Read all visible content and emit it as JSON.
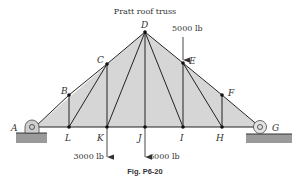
{
  "title": "Pratt roof truss",
  "caption": "Fig. P6-20",
  "colors": {
    "fill": "#d6d6d6",
    "member": "#222222",
    "ground": "#9a9a9a"
  },
  "nodes": {
    "A": {
      "label": "A",
      "x": 35,
      "y": 127
    },
    "B": {
      "label": "B",
      "x": 69,
      "y": 95
    },
    "C": {
      "label": "C",
      "x": 107,
      "y": 64
    },
    "D": {
      "label": "D",
      "x": 145,
      "y": 32
    },
    "E": {
      "label": "E",
      "x": 183,
      "y": 63
    },
    "F": {
      "label": "F",
      "x": 222,
      "y": 95
    },
    "G": {
      "label": "G",
      "x": 260,
      "y": 127
    },
    "H": {
      "label": "H",
      "x": 222,
      "y": 127
    },
    "I": {
      "label": "I",
      "x": 183,
      "y": 127
    },
    "J": {
      "label": "J",
      "x": 145,
      "y": 127
    },
    "K": {
      "label": "K",
      "x": 107,
      "y": 127
    },
    "L": {
      "label": "L",
      "x": 69,
      "y": 127
    }
  },
  "members": [
    [
      "A",
      "B"
    ],
    [
      "B",
      "C"
    ],
    [
      "C",
      "D"
    ],
    [
      "D",
      "E"
    ],
    [
      "E",
      "F"
    ],
    [
      "F",
      "G"
    ],
    [
      "A",
      "L"
    ],
    [
      "L",
      "K"
    ],
    [
      "K",
      "J"
    ],
    [
      "J",
      "I"
    ],
    [
      "I",
      "H"
    ],
    [
      "H",
      "G"
    ],
    [
      "B",
      "L"
    ],
    [
      "C",
      "K"
    ],
    [
      "D",
      "J"
    ],
    [
      "E",
      "I"
    ],
    [
      "F",
      "H"
    ],
    [
      "L",
      "C"
    ],
    [
      "K",
      "D"
    ],
    [
      "D",
      "I"
    ],
    [
      "E",
      "H"
    ]
  ],
  "loads": [
    {
      "label": "5000 lb",
      "at": "E",
      "direction": "down"
    },
    {
      "label": "3000 lb",
      "at": "K",
      "direction": "down"
    },
    {
      "label": "6000 lb",
      "at": "J",
      "direction": "down"
    }
  ],
  "supports": [
    {
      "at": "A",
      "type": "pin"
    },
    {
      "at": "G",
      "type": "roller"
    }
  ]
}
